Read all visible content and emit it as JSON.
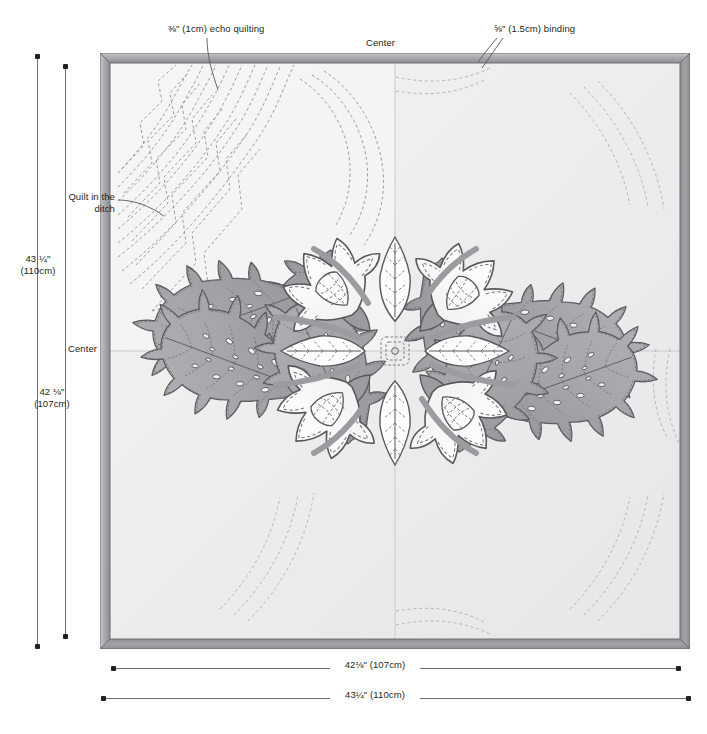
{
  "diagram": {
    "annotations": {
      "echo_quilting": "⅜\" (1cm) echo quilting",
      "binding": "⅝\" (1.5cm) binding",
      "center_top": "Center",
      "center_left": "Center",
      "quilt_in_the_ditch": "Quilt in the ditch"
    },
    "dimensions": {
      "left_outer": "43 ¼\"\n(110cm)",
      "left_outer_line1": "43 ¼\"",
      "left_outer_line2": "(110cm)",
      "left_inner_line1": "42 ⅛\"",
      "left_inner_line2": "(107cm)",
      "bottom_inner": "42⅛\" (107cm)",
      "bottom_outer": "43¼\" (110cm)"
    },
    "colors": {
      "binding": "#8e9093",
      "binding_light": "#b9bbbd",
      "binding_dark": "#76787b",
      "background_top_left": "#f4f4f3",
      "background_main": "#eceded",
      "background_shade": "#e3e4e5",
      "leaf_fill": "#a7a9ac",
      "leaf_fill_dark": "#939598",
      "flower_fill": "#ffffff",
      "outline": "#58595b",
      "stitch": "#6d6e71",
      "text": "#231f20",
      "rule": "#6d6e71"
    }
  }
}
